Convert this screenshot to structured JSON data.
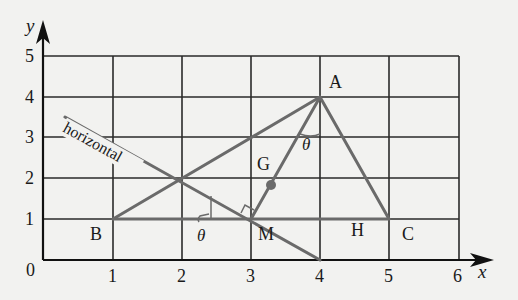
{
  "axes": {
    "x_label": "x",
    "y_label": "y",
    "x_ticks": [
      "0",
      "1",
      "2",
      "3",
      "4",
      "5",
      "6"
    ],
    "y_ticks": [
      "1",
      "2",
      "3",
      "4",
      "5"
    ],
    "origin_label": "0",
    "x_range": [
      0,
      6
    ],
    "y_range": [
      0,
      5
    ]
  },
  "points": {
    "A": {
      "label": "A",
      "x": 4,
      "y": 4
    },
    "B": {
      "label": "B",
      "x": 1,
      "y": 1
    },
    "C": {
      "label": "C",
      "x": 5,
      "y": 1
    },
    "M": {
      "label": "M",
      "x": 3,
      "y": 1
    },
    "G": {
      "label": "G",
      "x": 3.33,
      "y": 2
    },
    "H": {
      "label": "H",
      "x": 4.5,
      "y": 1
    }
  },
  "lines": {
    "horizontal_label": "horizontal",
    "angle_label_1": "θ",
    "angle_label_2": "θ"
  },
  "colors": {
    "grid": "#2a2a2a",
    "shape": "#6a6a6a",
    "background": "#f2f2f0"
  }
}
